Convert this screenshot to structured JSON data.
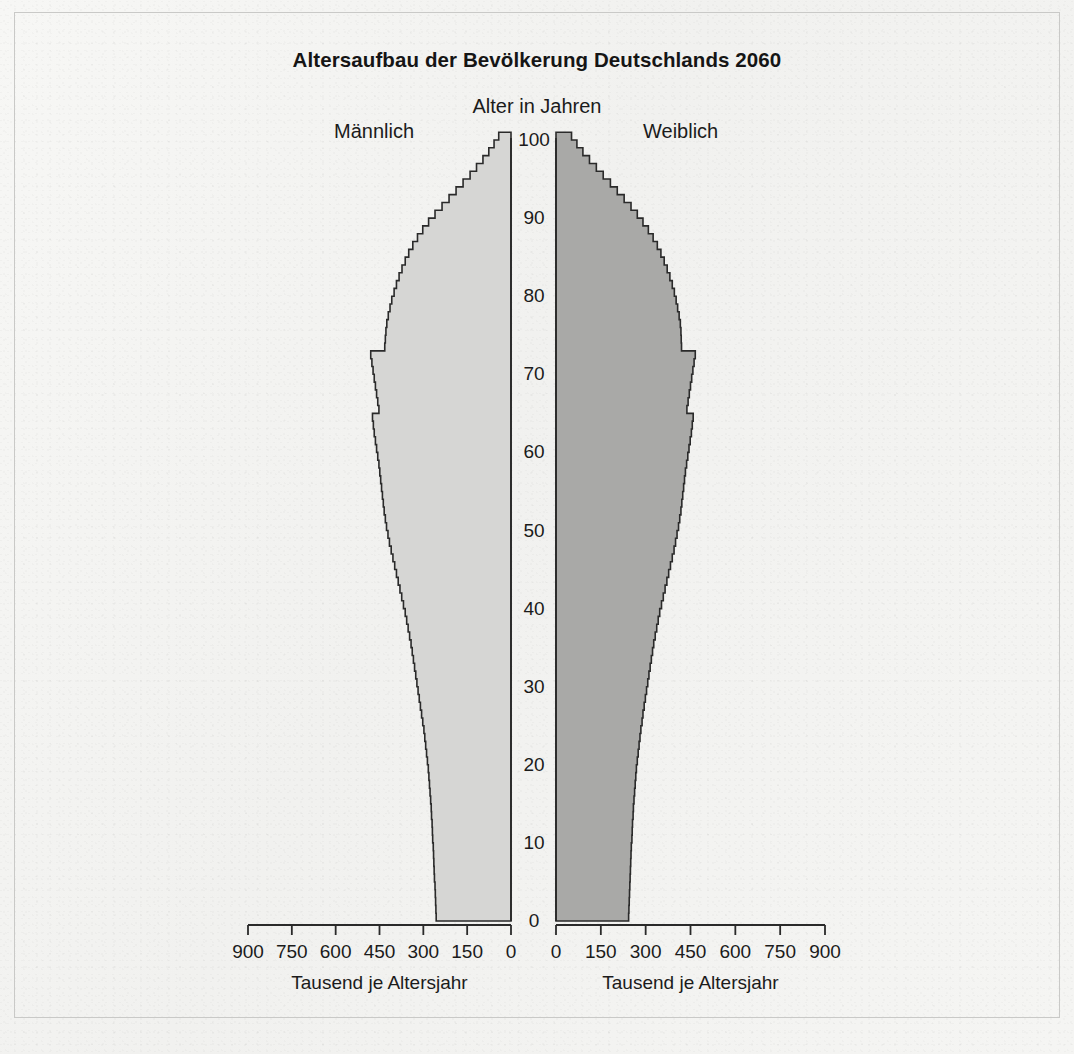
{
  "document": {
    "title": "Altersaufbau der Bevölkerung Deutschlands 2060",
    "footnote": ""
  },
  "headings": {
    "male": "Männlich",
    "female": "Weiblich",
    "age_axis": "Alter in Jahren"
  },
  "axis": {
    "x_caption_left": "Tausend je Altersjahr",
    "x_caption_right": "Tausend je Altersjahr",
    "x_ticks_left": [
      "900",
      "750",
      "600",
      "450",
      "300",
      "150",
      "0"
    ],
    "x_ticks_right": [
      "0",
      "150",
      "300",
      "450",
      "600",
      "750",
      "900"
    ],
    "y_ticks": [
      "0",
      "10",
      "20",
      "30",
      "40",
      "50",
      "60",
      "70",
      "80",
      "90",
      "100"
    ]
  },
  "colors": {
    "male_fill": "#d6d6d4",
    "female_fill": "#a9a9a7",
    "outline": "#2a2a2a",
    "paper": "#f4f4f2",
    "text": "#1b1b1b"
  },
  "chart_data": {
    "type": "bar",
    "orientation": "horizontal",
    "subtype": "population-pyramid",
    "title": "Altersaufbau der Bevölkerung Deutschlands 2060",
    "xlabel": "Tausend je Altersjahr",
    "ylabel": "Alter in Jahren",
    "xlim": [
      0,
      900
    ],
    "ylim": [
      0,
      100
    ],
    "xticks": [
      0,
      150,
      300,
      450,
      600,
      750,
      900
    ],
    "yticks": [
      0,
      10,
      20,
      30,
      40,
      50,
      60,
      70,
      80,
      90,
      100
    ],
    "grid": false,
    "legend_position": "top",
    "units": "Tausend Personen je Altersjahr",
    "ages": [
      0,
      1,
      2,
      3,
      4,
      5,
      6,
      7,
      8,
      9,
      10,
      11,
      12,
      13,
      14,
      15,
      16,
      17,
      18,
      19,
      20,
      21,
      22,
      23,
      24,
      25,
      26,
      27,
      28,
      29,
      30,
      31,
      32,
      33,
      34,
      35,
      36,
      37,
      38,
      39,
      40,
      41,
      42,
      43,
      44,
      45,
      46,
      47,
      48,
      49,
      50,
      51,
      52,
      53,
      54,
      55,
      56,
      57,
      58,
      59,
      60,
      61,
      62,
      63,
      64,
      65,
      66,
      67,
      68,
      69,
      70,
      71,
      72,
      73,
      74,
      75,
      76,
      77,
      78,
      79,
      80,
      81,
      82,
      83,
      84,
      85,
      86,
      87,
      88,
      89,
      90,
      91,
      92,
      93,
      94,
      95,
      96,
      97,
      98,
      99,
      100
    ],
    "series": [
      {
        "name": "Männlich",
        "side": "left",
        "color": "#d6d6d4",
        "values": [
          256,
          257,
          258,
          259,
          260,
          262,
          263,
          264,
          265,
          266,
          268,
          269,
          270,
          272,
          273,
          275,
          277,
          279,
          281,
          283,
          286,
          289,
          292,
          295,
          298,
          302,
          306,
          310,
          314,
          318,
          322,
          326,
          330,
          334,
          338,
          342,
          347,
          352,
          357,
          362,
          368,
          374,
          380,
          386,
          392,
          398,
          404,
          410,
          416,
          421,
          426,
          430,
          434,
          437,
          440,
          443,
          446,
          449,
          452,
          456,
          460,
          464,
          468,
          471,
          474,
          452,
          456,
          460,
          464,
          468,
          472,
          476,
          480,
          432,
          430,
          428,
          425,
          420,
          414,
          408,
          400,
          392,
          383,
          373,
          362,
          350,
          336,
          320,
          302,
          282,
          260,
          236,
          212,
          188,
          164,
          140,
          118,
          96,
          76,
          58,
          42
        ]
      },
      {
        "name": "Weiblich",
        "side": "right",
        "color": "#a9a9a7",
        "values": [
          243,
          244,
          245,
          246,
          247,
          248,
          249,
          250,
          251,
          252,
          254,
          255,
          256,
          258,
          259,
          261,
          263,
          265,
          267,
          269,
          272,
          275,
          278,
          281,
          284,
          288,
          291,
          295,
          299,
          303,
          307,
          311,
          315,
          319,
          323,
          327,
          332,
          337,
          342,
          347,
          353,
          359,
          365,
          371,
          377,
          383,
          389,
          395,
          400,
          405,
          410,
          414,
          418,
          421,
          424,
          427,
          430,
          433,
          437,
          441,
          445,
          449,
          453,
          456,
          459,
          438,
          442,
          446,
          450,
          454,
          458,
          462,
          466,
          420,
          419,
          418,
          416,
          412,
          407,
          402,
          396,
          389,
          381,
          372,
          362,
          351,
          339,
          325,
          309,
          291,
          272,
          251,
          228,
          205,
          182,
          158,
          135,
          112,
          90,
          70,
          52
        ]
      }
    ]
  }
}
